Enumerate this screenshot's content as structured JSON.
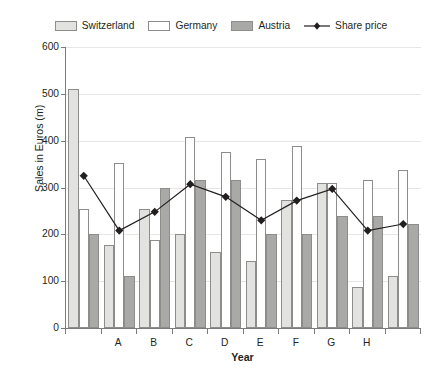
{
  "legend": {
    "items": [
      {
        "label": "Switzerland",
        "type": "swatch",
        "color": "#e2e2e0",
        "icon": "legend-swatch-icon"
      },
      {
        "label": "Germany",
        "type": "swatch",
        "color": "#ffffff",
        "icon": "legend-swatch-icon"
      },
      {
        "label": "Austria",
        "type": "swatch",
        "color": "#a9a9a7",
        "icon": "legend-swatch-icon"
      },
      {
        "label": "Share price",
        "type": "line",
        "color": "#231f20",
        "icon": "legend-line-marker-icon"
      }
    ]
  },
  "axes": {
    "y": {
      "label": "Sales in Euros (m)",
      "ticks": [
        "600",
        "500",
        "400",
        "300",
        "200",
        "100",
        "0"
      ],
      "min": 0,
      "max": 600,
      "step": 100
    },
    "x": {
      "label": "Year",
      "ticks": [
        "",
        "A",
        "B",
        "C",
        "D",
        "E",
        "F",
        "G",
        "H",
        ""
      ]
    }
  },
  "chart_data": {
    "type": "bar",
    "title": "",
    "subtitle": "",
    "xlabel": "Year",
    "ylabel": "Sales in Euros (m)",
    "ylim": [
      0,
      600
    ],
    "ytick_step": 100,
    "grid": true,
    "legend_position": "top",
    "categories": [
      "",
      "A",
      "B",
      "C",
      "D",
      "E",
      "F",
      "G",
      "H",
      ""
    ],
    "series": [
      {
        "name": "Switzerland",
        "type": "bar",
        "color": "#e2e2e0",
        "values": [
          510,
          178,
          254,
          200,
          163,
          143,
          273,
          310,
          88,
          110
        ]
      },
      {
        "name": "Germany",
        "type": "bar",
        "color": "#ffffff",
        "values": [
          255,
          353,
          188,
          407,
          375,
          361,
          388,
          310,
          315,
          338
        ]
      },
      {
        "name": "Austria",
        "type": "bar",
        "color": "#a9a9a7",
        "values": [
          200,
          111,
          300,
          315,
          315,
          200,
          200,
          240,
          240,
          222
        ]
      },
      {
        "name": "Share price",
        "type": "line",
        "color": "#231f20",
        "marker": "diamond",
        "values": [
          325,
          208,
          248,
          307,
          280,
          230,
          272,
          297,
          208,
          222
        ]
      }
    ]
  }
}
